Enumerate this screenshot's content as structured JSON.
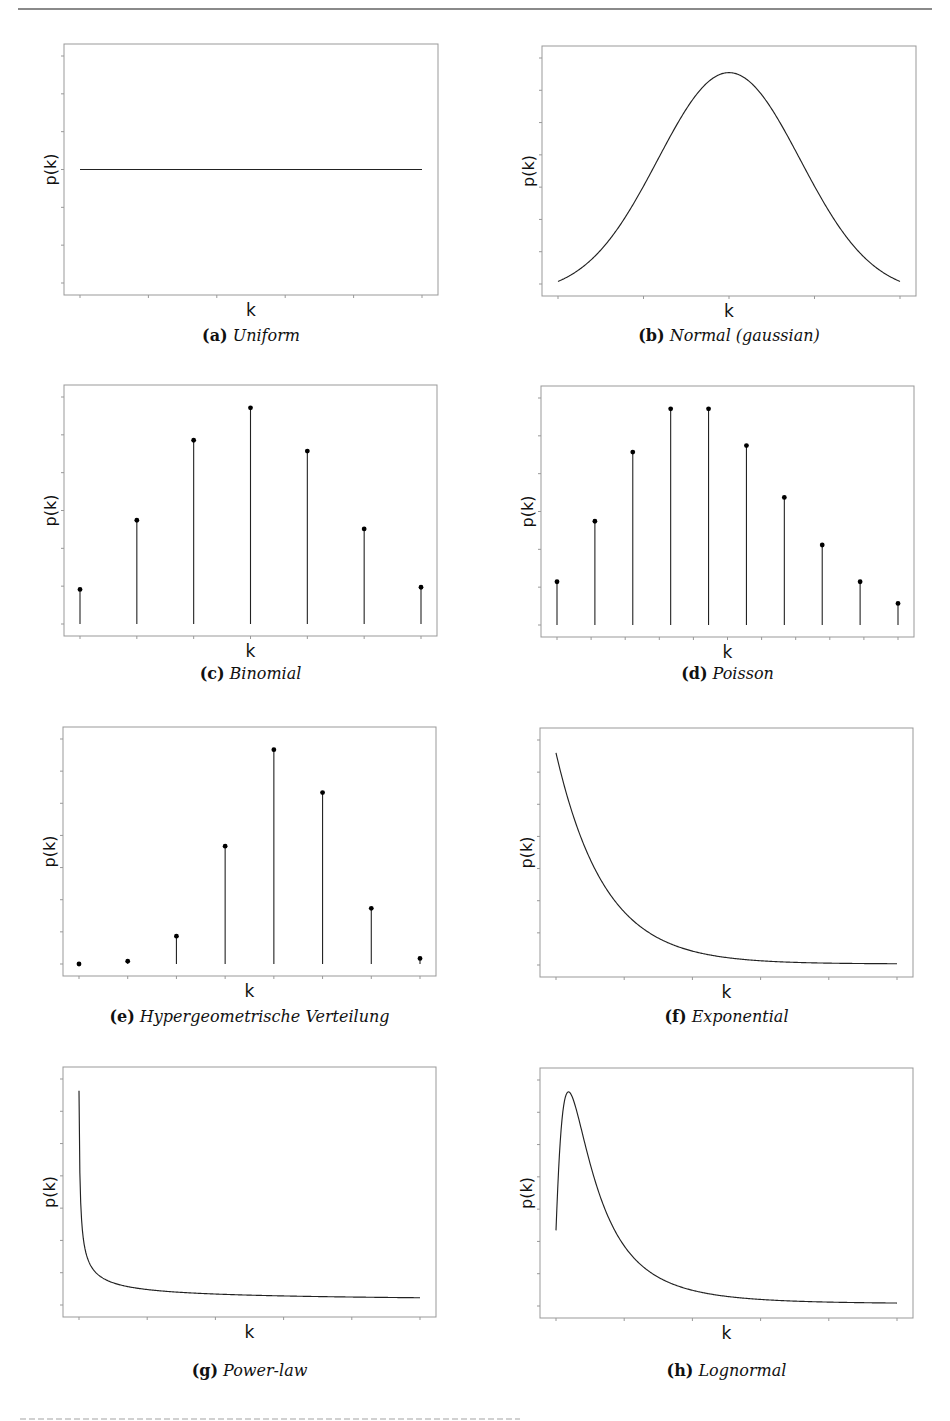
{
  "figure": {
    "axis_color": "#999999",
    "line_color": "#222222",
    "clipped_bottom_text": "(illegible, cut off)"
  },
  "chart_data": [
    {
      "id": "a",
      "type": "line",
      "label": "(a)",
      "title": "Uniform",
      "xlabel": "k",
      "ylabel": "p(k)",
      "grid": false,
      "x_ticks": 6,
      "y_ticks": 7,
      "function": "uniform",
      "x": [
        0,
        1
      ],
      "y": [
        0.5,
        0.5
      ],
      "ylim": [
        0,
        1
      ]
    },
    {
      "id": "b",
      "type": "line",
      "label": "(b)",
      "title": "Normal (gaussian)",
      "xlabel": "k",
      "ylabel": "p(k)",
      "grid": false,
      "x_ticks": 5,
      "y_ticks": 8,
      "function": "gaussian",
      "params": {
        "mu": 0,
        "sigma": 1
      },
      "xlim": [
        -2.4,
        2.4
      ],
      "ylim": [
        0,
        1.05
      ]
    },
    {
      "id": "c",
      "type": "stem",
      "label": "(c)",
      "title": "Binomial",
      "xlabel": "k",
      "ylabel": "p(k)",
      "grid": false,
      "x_ticks": 7,
      "y_ticks": 7,
      "categories": [
        0,
        1,
        2,
        3,
        4,
        5,
        6
      ],
      "values": [
        0.16,
        0.48,
        0.85,
        1.0,
        0.8,
        0.44,
        0.17
      ],
      "ylim": [
        0,
        1.05
      ]
    },
    {
      "id": "d",
      "type": "stem",
      "label": "(d)",
      "title": "Poisson",
      "xlabel": "k",
      "ylabel": "p(k)",
      "grid": false,
      "x_ticks": 11,
      "y_ticks": 7,
      "categories": [
        1,
        2,
        3,
        4,
        5,
        6,
        7,
        8,
        9,
        10
      ],
      "values": [
        0.2,
        0.48,
        0.8,
        1.0,
        1.0,
        0.83,
        0.59,
        0.37,
        0.2,
        0.1
      ],
      "ylim": [
        0,
        1.05
      ]
    },
    {
      "id": "e",
      "type": "stem",
      "label": "(e)",
      "title": "Hypergeometrische Verteilung",
      "xlabel": "k",
      "ylabel": "p(k)",
      "grid": false,
      "x_ticks": 8,
      "y_ticks": 8,
      "categories": [
        0,
        1,
        2,
        3,
        4,
        5,
        6,
        7
      ],
      "values": [
        0.0,
        0.013,
        0.13,
        0.55,
        1.0,
        0.8,
        0.26,
        0.026
      ],
      "ylim": [
        0,
        1.05
      ]
    },
    {
      "id": "f",
      "type": "line",
      "label": "(f)",
      "title": "Exponential",
      "xlabel": "k",
      "ylabel": "p(k)",
      "grid": false,
      "x_ticks": 6,
      "y_ticks": 8,
      "function": "exponential",
      "params": {
        "lambda": 1
      },
      "xlim": [
        0,
        7
      ],
      "ylim": [
        0,
        1.05
      ]
    },
    {
      "id": "g",
      "type": "line",
      "label": "(g)",
      "title": "Power-law",
      "xlabel": "k",
      "ylabel": "p(k)",
      "grid": false,
      "x_ticks": 6,
      "y_ticks": 8,
      "function": "power-law",
      "params": {
        "alpha": 0.6
      },
      "xlim": [
        0.002,
        1
      ],
      "ylim": [
        0,
        1.05
      ]
    },
    {
      "id": "h",
      "type": "line",
      "label": "(h)",
      "title": "Lognormal",
      "xlabel": "k",
      "ylabel": "p(k)",
      "grid": false,
      "x_ticks": 6,
      "y_ticks": 8,
      "function": "lognormal",
      "params": {
        "mu": 0,
        "sigma": 0.9
      },
      "xlim": [
        0.12,
        9
      ],
      "ylim": [
        0,
        1.05
      ]
    }
  ]
}
